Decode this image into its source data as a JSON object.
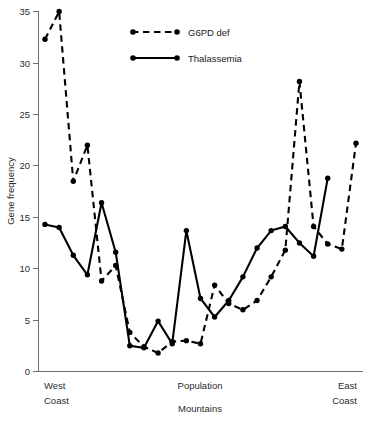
{
  "chart_data": {
    "type": "line",
    "title": "",
    "xlabel": "Population",
    "ylabel": "Gene frequency",
    "ylim": [
      0,
      35
    ],
    "yticks": [
      0,
      5,
      10,
      15,
      20,
      25,
      30,
      35
    ],
    "ytick_labels": [
      "0",
      "5",
      "10",
      "15",
      "20",
      "25",
      "30",
      "35"
    ],
    "grid": false,
    "legend_position": "top-center",
    "x_category_labels": [
      {
        "id": "west-coast",
        "line1": "West",
        "line2": "Coast",
        "position": "left"
      },
      {
        "id": "population",
        "line1": "Population",
        "line2": "Mountains",
        "position": "center"
      },
      {
        "id": "east-coast",
        "line1": "East",
        "line2": "Coast",
        "position": "right"
      }
    ],
    "x": [
      1,
      2,
      3,
      4,
      5,
      6,
      7,
      8,
      9,
      10,
      11,
      12,
      13,
      14,
      15,
      16,
      17,
      18,
      19,
      20,
      21,
      22,
      23,
      24,
      25
    ],
    "series": [
      {
        "name": "G6PD def",
        "style": "dashed",
        "values": [
          32.3,
          35.0,
          18.5,
          22.0,
          8.8,
          10.3,
          3.8,
          2.4,
          1.8,
          2.9,
          3.0,
          2.7,
          8.4,
          6.6,
          6.0,
          6.9,
          9.2,
          11.8,
          28.2,
          14.1,
          12.4,
          11.9,
          22.2,
          null,
          null
        ]
      },
      {
        "name": "Thalassemia",
        "style": "solid",
        "values": [
          14.3,
          14.0,
          11.3,
          9.4,
          16.4,
          11.6,
          2.5,
          2.3,
          4.9,
          2.7,
          13.7,
          7.1,
          5.3,
          6.9,
          9.2,
          12.0,
          13.7,
          14.1,
          12.5,
          11.2,
          18.8,
          null,
          null,
          null,
          null
        ]
      }
    ],
    "annotations": []
  },
  "legend": {
    "entries": [
      {
        "id": "legend-g6pd",
        "label": "G6PD def",
        "style": "dashed"
      },
      {
        "id": "legend-thalassemia",
        "label": "Thalassemia",
        "style": "solid"
      }
    ]
  },
  "axes": {
    "y_title": "Gene frequency"
  }
}
